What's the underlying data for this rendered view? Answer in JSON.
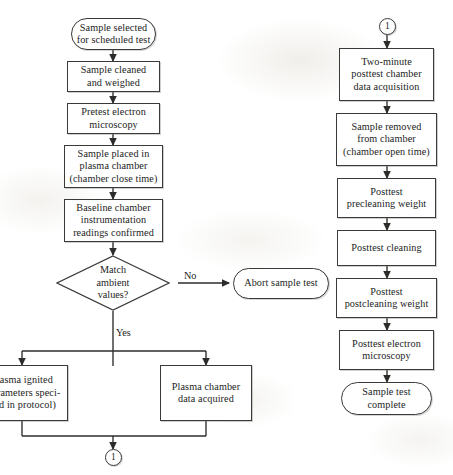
{
  "diagram": {
    "background_color": "#fdfdfc",
    "line_color": "#3a3a38",
    "text_color": "#1c1c1c"
  },
  "left_column": {
    "nodes": [
      {
        "id": "start",
        "shape": "terminal",
        "label": "Sample selected\nfor scheduled test"
      },
      {
        "id": "cleaned",
        "shape": "process",
        "label": "Sample cleaned\nand weighed"
      },
      {
        "id": "pretest_em",
        "shape": "process",
        "label": "Pretest electron\nmicroscopy"
      },
      {
        "id": "placed",
        "shape": "process",
        "label": "Sample placed in\nplasma chamber\n(chamber close time)"
      },
      {
        "id": "baseline",
        "shape": "process",
        "label": "Baseline chamber\ninstrumentation\nreadings confirmed"
      },
      {
        "id": "match",
        "shape": "decision",
        "label": "Match\nambient\nvalues?"
      },
      {
        "id": "abort",
        "shape": "terminal",
        "label": "Abort sample test"
      },
      {
        "id": "plasma_ignited",
        "shape": "process",
        "label": "Plasma ignited\n(parameters speci-\nfied in protocol)"
      },
      {
        "id": "plasma_data",
        "shape": "process",
        "label": "Plasma chamber\ndata acquired"
      },
      {
        "id": "connector_out",
        "shape": "connector",
        "label": "1"
      }
    ],
    "edge_labels": {
      "no": "No",
      "yes": "Yes"
    }
  },
  "right_column": {
    "nodes": [
      {
        "id": "connector_in",
        "shape": "connector",
        "label": "1"
      },
      {
        "id": "two_minute",
        "shape": "process",
        "label": "Two-minute\nposttest chamber\ndata acquisition"
      },
      {
        "id": "removed",
        "shape": "process",
        "label": "Sample removed\nfrom chamber\n(chamber open time)"
      },
      {
        "id": "precleaning",
        "shape": "process",
        "label": "Posttest\nprecleaning weight"
      },
      {
        "id": "posttest_clean",
        "shape": "process",
        "label": "Posttest cleaning"
      },
      {
        "id": "postcleaning",
        "shape": "process",
        "label": "Posttest\npostcleaning weight"
      },
      {
        "id": "posttest_em",
        "shape": "process",
        "label": "Posttest electron\nmicroscopy"
      },
      {
        "id": "complete",
        "shape": "terminal",
        "label": "Sample test\ncomplete"
      }
    ]
  }
}
